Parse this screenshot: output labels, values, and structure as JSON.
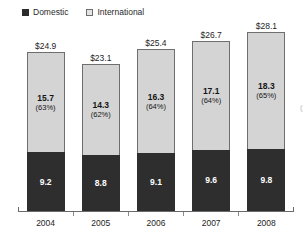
{
  "chart_data": {
    "type": "bar",
    "subtype": "stacked-bar",
    "title": "",
    "xlabel": "",
    "ylabel": "",
    "categories": [
      "2004",
      "2005",
      "2006",
      "2007",
      "2008"
    ],
    "ylim": [
      0,
      28.1
    ],
    "grid": false,
    "legend_position": "top-left",
    "series": [
      {
        "name": "Domestic",
        "color": "#2e2e2e",
        "values": [
          9.2,
          8.8,
          9.1,
          9.6,
          9.8
        ],
        "value_labels": [
          "9.2",
          "8.8",
          "9.1",
          "9.6",
          "9.8"
        ]
      },
      {
        "name": "International",
        "color": "#d4d4d4",
        "values": [
          15.7,
          14.3,
          16.3,
          17.1,
          18.3
        ],
        "value_labels": [
          "15.7",
          "14.3",
          "16.3",
          "17.1",
          "18.3"
        ],
        "pct_labels": [
          "(63%)",
          "(62%)",
          "(64%)",
          "(64%)",
          "(65%)"
        ],
        "pct_values": [
          63,
          62,
          64,
          64,
          65
        ]
      }
    ],
    "totals": [
      24.9,
      23.1,
      25.4,
      26.7,
      28.1
    ],
    "total_labels": [
      "$24.9",
      "$23.1",
      "$25.4",
      "$26.7",
      "$28.1"
    ]
  },
  "legend": {
    "items": [
      {
        "label": "Domestic",
        "swatch": "filled-dark-square"
      },
      {
        "label": "International",
        "swatch": "outlined-light-square"
      }
    ]
  },
  "colors": {
    "domestic": "#2e2e2e",
    "international": "#d4d4d4",
    "bar_outline": "#6e6e6e",
    "axis": "#6a6a6a",
    "background": "#ffffff",
    "text": "#1e1e1e"
  },
  "edge_artifact": "("
}
